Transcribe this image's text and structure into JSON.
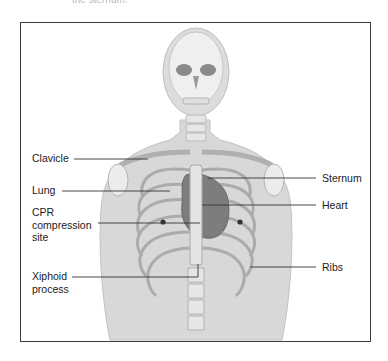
{
  "figure": {
    "cropped_caption": "the sternum."
  },
  "labels": {
    "clavicle": "Clavicle",
    "lung": "Lung",
    "cpr_site": "CPR\ncompression\nsite",
    "xiphoid": "Xiphoid\nprocess",
    "sternum": "Sternum",
    "heart": "Heart",
    "ribs": "Ribs"
  },
  "colors": {
    "frame": "#3a3a3a",
    "body": "#d6d6d6",
    "bone": "#ececec",
    "heart": "#7a7a7a",
    "leader": "#333333"
  }
}
